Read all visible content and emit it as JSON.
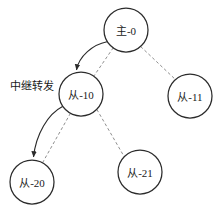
{
  "diagram": {
    "type": "node-link-topology",
    "width": 219,
    "height": 206,
    "background": "#ffffff",
    "nodes": [
      {
        "id": "master-0",
        "label": "主-0",
        "cx": 126,
        "cy": 30,
        "r": 22
      },
      {
        "id": "slave-10",
        "label": "从-10",
        "cx": 81,
        "cy": 94,
        "r": 22
      },
      {
        "id": "slave-11",
        "label": "从-11",
        "cx": 190,
        "cy": 96,
        "r": 22
      },
      {
        "id": "slave-20",
        "label": "从-20",
        "cx": 32,
        "cy": 182,
        "r": 22
      },
      {
        "id": "slave-21",
        "label": "从-21",
        "cx": 140,
        "cy": 172,
        "r": 22
      }
    ],
    "edges": [
      {
        "id": "edge-master0-slave10-dashed",
        "from": "master-0",
        "to": "slave-10",
        "style": "dashed",
        "arrow": "none"
      },
      {
        "id": "edge-master0-slave11-dashed",
        "from": "master-0",
        "to": "slave-11",
        "style": "dashed",
        "arrow": "none"
      },
      {
        "id": "edge-slave10-slave20-dashed",
        "from": "slave-10",
        "to": "slave-20",
        "style": "dashed",
        "arrow": "none"
      },
      {
        "id": "edge-slave10-slave21-dashed",
        "from": "slave-10",
        "to": "slave-21",
        "style": "dashed",
        "arrow": "none"
      },
      {
        "id": "edge-master0-slave10-curve",
        "from": "master-0",
        "to": "slave-10",
        "style": "solid",
        "arrow": "both"
      },
      {
        "id": "edge-slave10-slave20-curve",
        "from": "slave-10",
        "to": "slave-20",
        "style": "solid",
        "arrow": "both"
      }
    ],
    "annotations": [
      {
        "id": "relay-forward-label",
        "text": "中继转发",
        "x": 10,
        "y": 86
      }
    ],
    "colors": {
      "node_stroke": "#2b2b2b",
      "node_fill": "#ffffff",
      "dashed_edge": "#8f8f8f",
      "solid_edge": "#2b2b2b",
      "text": "#1a1a1a"
    }
  }
}
